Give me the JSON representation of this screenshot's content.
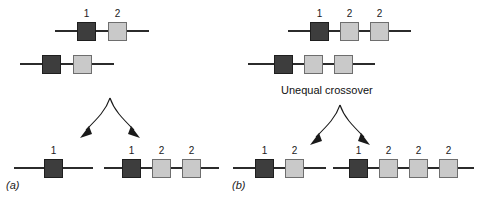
{
  "figure": {
    "crossover_label": "Unequal crossover",
    "colors": {
      "dark_segment": "#3d3d3d",
      "light_segment": "#c9c9c9",
      "line": "#2b2b2b",
      "background": "#ffffff"
    }
  },
  "panels": [
    {
      "id": "a",
      "label": "(a)",
      "parents": [
        {
          "name": "parent-chromosome-top",
          "segments": [
            {
              "type": "dark",
              "label": "1"
            },
            {
              "type": "light",
              "label": "2"
            }
          ]
        },
        {
          "name": "parent-chromosome-bottom",
          "segments": [
            {
              "type": "dark",
              "label": ""
            },
            {
              "type": "light",
              "label": ""
            }
          ]
        }
      ],
      "products": [
        {
          "name": "product-chromosome-left",
          "segments": [
            {
              "type": "dark",
              "label": "1"
            }
          ]
        },
        {
          "name": "product-chromosome-right",
          "segments": [
            {
              "type": "dark",
              "label": "1"
            },
            {
              "type": "light",
              "label": "2"
            },
            {
              "type": "light",
              "label": "2"
            }
          ]
        }
      ]
    },
    {
      "id": "b",
      "label": "(b)",
      "parents": [
        {
          "name": "parent-chromosome-top",
          "segments": [
            {
              "type": "dark",
              "label": "1"
            },
            {
              "type": "light",
              "label": "2"
            },
            {
              "type": "light",
              "label": "2"
            }
          ]
        },
        {
          "name": "parent-chromosome-bottom",
          "segments": [
            {
              "type": "dark",
              "label": ""
            },
            {
              "type": "light",
              "label": ""
            },
            {
              "type": "light",
              "label": ""
            }
          ]
        }
      ],
      "products": [
        {
          "name": "product-chromosome-left",
          "segments": [
            {
              "type": "dark",
              "label": "1"
            },
            {
              "type": "light",
              "label": "2"
            }
          ]
        },
        {
          "name": "product-chromosome-right",
          "segments": [
            {
              "type": "dark",
              "label": "1"
            },
            {
              "type": "light",
              "label": "2"
            },
            {
              "type": "light",
              "label": "2"
            },
            {
              "type": "light",
              "label": "2"
            }
          ]
        }
      ]
    }
  ]
}
